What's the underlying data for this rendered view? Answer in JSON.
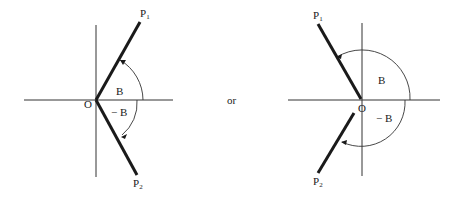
{
  "diagram": {
    "connector_label": "or",
    "left": {
      "origin_label": "O",
      "p1_label": "P",
      "p1_sub": "1",
      "p2_label": "P",
      "p2_sub": "2",
      "angle_pos_label": "B",
      "angle_neg_label": "− B"
    },
    "right": {
      "origin_label": "O",
      "p1_label": "P",
      "p1_sub": "1",
      "p2_label": "P",
      "p2_sub": "2",
      "angle_pos_label": "B",
      "angle_neg_label": "− B"
    }
  }
}
